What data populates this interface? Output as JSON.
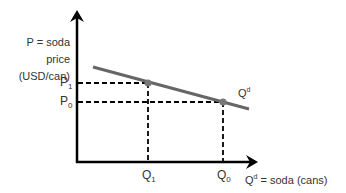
{
  "y_axis": {
    "line1": "P = soda",
    "line2": "price",
    "line3": "(USD/can)"
  },
  "x_axis": {
    "label": "Q",
    "sup": "d",
    "rest": " = soda (cans)"
  },
  "curve_label": {
    "base": "Q",
    "sup": "d"
  },
  "price_ticks": [
    {
      "base": "P",
      "sub": "1"
    },
    {
      "base": "P",
      "sub": "0"
    }
  ],
  "quantity_ticks": [
    {
      "base": "Q",
      "sub": "1"
    },
    {
      "base": "Q",
      "sub": "0"
    }
  ],
  "colors": {
    "axis": "#000000",
    "curve": "#666666",
    "point": "#777777",
    "dash": "#000000"
  }
}
